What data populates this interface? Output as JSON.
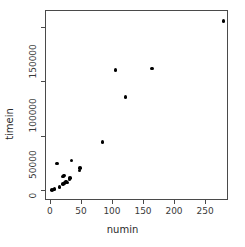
{
  "chart_data": {
    "type": "scatter",
    "title": "",
    "xlabel": "numin",
    "ylabel": "timein",
    "xlim": [
      -8,
      287
    ],
    "ylim": [
      -9500,
      166000
    ],
    "xticks": [
      0,
      50,
      100,
      150,
      200,
      250
    ],
    "xticklabels": [
      "0",
      "50",
      "100",
      "150",
      "200",
      "250"
    ],
    "yticks": [
      0,
      50000,
      100000,
      150000
    ],
    "yticklabels": [
      "0",
      "50000",
      "100000",
      "150000"
    ],
    "grid": false,
    "legend": null,
    "marker": "filled-circle",
    "marker_color": "#000000",
    "points": [
      {
        "x": 278,
        "y": 157000
      },
      {
        "x": 163,
        "y": 113000
      },
      {
        "x": 104,
        "y": 111500
      },
      {
        "x": 120,
        "y": 86500
      },
      {
        "x": 83,
        "y": 45000
      },
      {
        "x": 33,
        "y": 28000
      },
      {
        "x": 10,
        "y": 25000
      },
      {
        "x": 47,
        "y": 21000
      },
      {
        "x": 46,
        "y": 18500
      },
      {
        "x": 21,
        "y": 14000
      },
      {
        "x": 19,
        "y": 13000
      },
      {
        "x": 31,
        "y": 12000
      },
      {
        "x": 30,
        "y": 10500
      },
      {
        "x": 24,
        "y": 8500
      },
      {
        "x": 26,
        "y": 7500
      },
      {
        "x": 22,
        "y": 7000
      },
      {
        "x": 19,
        "y": 6000
      },
      {
        "x": 14,
        "y": 3500
      },
      {
        "x": 6,
        "y": 1500
      },
      {
        "x": 4,
        "y": 1000
      },
      {
        "x": 2,
        "y": 500
      }
    ]
  },
  "axes": {
    "x_axis_name": "numin",
    "y_axis_name": "timein"
  }
}
